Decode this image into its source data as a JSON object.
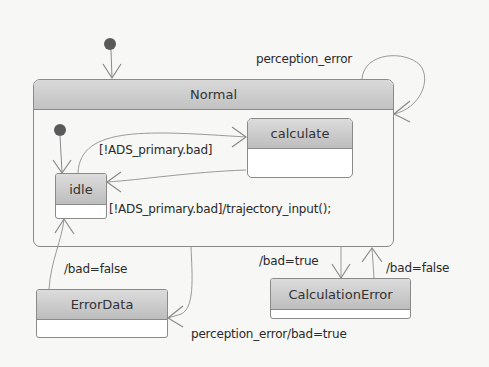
{
  "diagram": {
    "type": "state-machine",
    "states": {
      "normal": "Normal",
      "calculate": "calculate",
      "idle": "idle",
      "error_data": "ErrorData",
      "calculation_error": "CalculationError"
    },
    "transitions": {
      "normal_self_loop": "perception_error",
      "idle_to_calculate": "[!ADS_primary.bad]",
      "calculate_to_idle": "[!ADS_primary.bad]/trajectory_input();",
      "normal_to_error_data": "perception_error/bad=true",
      "error_data_to_idle": "/bad=false",
      "normal_to_calculation_error": "/bad=true",
      "calculation_error_to_normal": "/bad=false"
    },
    "colors": {
      "header_top": "#dcdcdc",
      "header_bottom": "#bdbdbd",
      "border": "#8a8a8a",
      "initial_dot": "#555555",
      "edge": "#9a9a9a"
    }
  }
}
